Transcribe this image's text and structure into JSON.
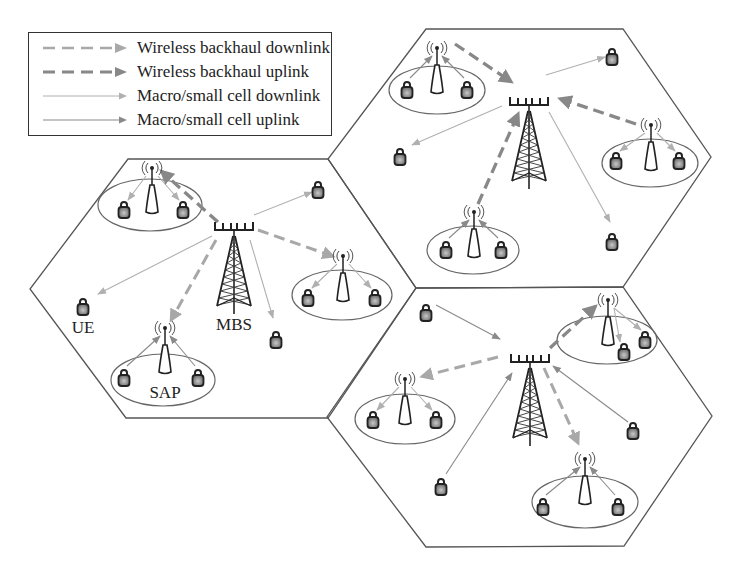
{
  "legend": {
    "items": [
      {
        "label": "Wireless backhaul downlink",
        "style": "dashed",
        "color": "#a8a8a8",
        "width": 2.5
      },
      {
        "label": "Wireless backhaul uplink",
        "style": "dashed",
        "color": "#888888",
        "width": 3
      },
      {
        "label": "Macro/small cell downlink",
        "style": "solid",
        "color": "#b0b0b0",
        "width": 1
      },
      {
        "label": "Macro/small cell uplink",
        "style": "solid",
        "color": "#8a8a8a",
        "width": 1.2
      }
    ]
  },
  "labels": {
    "ue": "UE",
    "mbs": "MBS",
    "sap": "SAP"
  },
  "colors": {
    "hex_border": "#555555",
    "backhaul_down": "#a8a8a8",
    "backhaul_up": "#888888",
    "access_down": "#b0b0b0",
    "access_up": "#8a8a8a",
    "ue_fill": "#8a8a8a",
    "ue_stroke": "#222222"
  },
  "cells": [
    {
      "name": "left-cell",
      "hexagon": [
        [
          128,
          159
        ],
        [
          328,
          159
        ],
        [
          416,
          288
        ],
        [
          328,
          418
        ],
        [
          126,
          418
        ],
        [
          30,
          289
        ]
      ],
      "mbs": {
        "x": 234,
        "y": 222
      },
      "saps": [
        {
          "x": 152,
          "y": 168,
          "ellipse": [
            150,
            205,
            52,
            26
          ],
          "ues": [
            [
              124,
              210
            ],
            [
              183,
              210
            ]
          ],
          "link": "down"
        },
        {
          "x": 343,
          "y": 256,
          "ellipse": [
            342,
            295,
            50,
            25
          ],
          "ues": [
            [
              308,
              298
            ],
            [
              375,
              298
            ]
          ],
          "link": "down"
        },
        {
          "x": 165,
          "y": 328,
          "ellipse": [
            163,
            380,
            52,
            26
          ],
          "ues": [
            [
              124,
              378
            ],
            [
              198,
              378
            ]
          ],
          "link": "up"
        }
      ],
      "backhaul": [
        {
          "from": [
            218,
            222
          ],
          "to": [
            160,
            170
          ],
          "dir": "up"
        },
        {
          "from": [
            258,
            230
          ],
          "to": [
            335,
            257
          ],
          "dir": "down"
        },
        {
          "from": [
            216,
            240
          ],
          "to": [
            170,
            322
          ],
          "dir": "down"
        }
      ],
      "free_ues": [
        [
          318,
          190
        ],
        [
          83,
          307
        ],
        [
          276,
          340
        ]
      ],
      "access": [
        {
          "from": [
            254,
            215
          ],
          "to": [
            312,
            192
          ],
          "dir": "down"
        },
        {
          "from": [
            212,
            236
          ],
          "to": [
            98,
            294
          ],
          "dir": "down"
        },
        {
          "from": [
            250,
            240
          ],
          "to": [
            273,
            318
          ],
          "dir": "down"
        }
      ]
    },
    {
      "name": "top-cell",
      "hexagon": [
        [
          426,
          29
        ],
        [
          623,
          29
        ],
        [
          711,
          157
        ],
        [
          623,
          287
        ],
        [
          416,
          288
        ],
        [
          328,
          159
        ]
      ],
      "mbs": {
        "x": 529,
        "y": 97
      },
      "saps": [
        {
          "x": 437,
          "y": 48,
          "ellipse": [
            437,
            90,
            48,
            24
          ],
          "ues": [
            [
              407,
              90
            ],
            [
              467,
              90
            ]
          ],
          "link": "up"
        },
        {
          "x": 651,
          "y": 125,
          "ellipse": [
            650,
            163,
            48,
            24
          ],
          "ues": [
            [
              616,
              161
            ],
            [
              679,
              161
            ]
          ],
          "link": "down"
        },
        {
          "x": 474,
          "y": 212,
          "ellipse": [
            473,
            250,
            46,
            24
          ],
          "ues": [
            [
              446,
              250
            ],
            [
              501,
              250
            ]
          ],
          "link": "up"
        }
      ],
      "backhaul": [
        {
          "from": [
            455,
            44
          ],
          "to": [
            513,
            83
          ],
          "dir": "up"
        },
        {
          "from": [
            636,
            124
          ],
          "to": [
            558,
            98
          ],
          "dir": "up"
        },
        {
          "from": [
            478,
            204
          ],
          "to": [
            519,
            112
          ],
          "dir": "up"
        }
      ],
      "free_ues": [
        [
          612,
          57
        ],
        [
          400,
          157
        ],
        [
          612,
          242
        ]
      ],
      "access": [
        {
          "from": [
            546,
            75
          ],
          "to": [
            605,
            57
          ],
          "dir": "down"
        },
        {
          "from": [
            502,
            106
          ],
          "to": [
            412,
            145
          ],
          "dir": "down"
        },
        {
          "from": [
            549,
            112
          ],
          "to": [
            610,
            222
          ],
          "dir": "down"
        }
      ]
    },
    {
      "name": "bottom-cell",
      "hexagon": [
        [
          416,
          288
        ],
        [
          623,
          287
        ],
        [
          712,
          416
        ],
        [
          624,
          546
        ],
        [
          426,
          547
        ],
        [
          327,
          417
        ]
      ],
      "mbs": {
        "x": 530,
        "y": 354
      },
      "saps": [
        {
          "x": 608,
          "y": 300,
          "ellipse": [
            607,
            340,
            50,
            24
          ],
          "ues": [
            [
              624,
              352
            ],
            [
              645,
              340
            ]
          ],
          "link": "down"
        },
        {
          "x": 405,
          "y": 379,
          "ellipse": [
            405,
            419,
            50,
            25
          ],
          "ues": [
            [
              373,
              420
            ],
            [
              436,
              420
            ]
          ],
          "link": "down"
        },
        {
          "x": 585,
          "y": 459,
          "ellipse": [
            585,
            502,
            53,
            26
          ],
          "ues": [
            [
              543,
              507
            ],
            [
              618,
              507
            ]
          ],
          "link": "up"
        }
      ],
      "backhaul": [
        {
          "from": [
            550,
            348
          ],
          "to": [
            597,
            305
          ],
          "dir": "up"
        },
        {
          "from": [
            498,
            357
          ],
          "to": [
            420,
            377
          ],
          "dir": "down"
        },
        {
          "from": [
            544,
            368
          ],
          "to": [
            579,
            445
          ],
          "dir": "down"
        }
      ],
      "free_ues": [
        [
          426,
          313
        ],
        [
          633,
          431
        ],
        [
          441,
          487
        ]
      ],
      "access": [
        {
          "from": [
            436,
            305
          ],
          "to": [
            500,
            339
          ],
          "dir": "up"
        },
        {
          "from": [
            628,
            422
          ],
          "to": [
            553,
            366
          ],
          "dir": "up"
        },
        {
          "from": [
            446,
            474
          ],
          "to": [
            512,
            373
          ],
          "dir": "up"
        }
      ]
    }
  ],
  "label_positions": {
    "ue": [
      83,
      318
    ],
    "mbs": [
      234,
      315
    ],
    "sap": [
      165,
      383
    ]
  }
}
